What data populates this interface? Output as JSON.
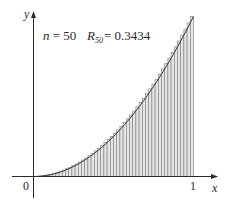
{
  "chart_data": {
    "type": "bar",
    "title": "",
    "function": "x^2",
    "n": 50,
    "method": "right endpoints",
    "xlabel": "x",
    "ylabel": "y",
    "xlim": [
      0,
      1
    ],
    "ylim": [
      0,
      1
    ],
    "x_tick_labels": [
      "0",
      "1"
    ],
    "annotation": {
      "n_text": "n = 50",
      "r_symbol": "R",
      "r_subscript": "50",
      "r_value_text": "= 0.3434",
      "R50": 0.3434
    },
    "categories": [
      0.02,
      0.04,
      0.06,
      0.08,
      0.1,
      0.12,
      0.14,
      0.16,
      0.18,
      0.2,
      0.22,
      0.24,
      0.26,
      0.28,
      0.3,
      0.32,
      0.34,
      0.36,
      0.38,
      0.4,
      0.42,
      0.44,
      0.46,
      0.48,
      0.5,
      0.52,
      0.54,
      0.56,
      0.58,
      0.6,
      0.62,
      0.64,
      0.66,
      0.68,
      0.7,
      0.72,
      0.74,
      0.76,
      0.78,
      0.8,
      0.82,
      0.84,
      0.86,
      0.88,
      0.9,
      0.92,
      0.94,
      0.96,
      0.98,
      1.0
    ],
    "values": [
      0.0004,
      0.0016,
      0.0036,
      0.0064,
      0.01,
      0.0144,
      0.0196,
      0.0256,
      0.0324,
      0.04,
      0.0484,
      0.0576,
      0.0676,
      0.0784,
      0.09,
      0.1024,
      0.1156,
      0.1296,
      0.1444,
      0.16,
      0.1764,
      0.1936,
      0.2116,
      0.2304,
      0.25,
      0.2704,
      0.2916,
      0.3136,
      0.3364,
      0.36,
      0.3844,
      0.4096,
      0.4356,
      0.4624,
      0.49,
      0.5184,
      0.5476,
      0.5776,
      0.6084,
      0.64,
      0.6724,
      0.7056,
      0.7396,
      0.7744,
      0.81,
      0.8464,
      0.8836,
      0.9216,
      0.9604,
      1.0
    ],
    "colors": {
      "bar_fill": "#e6e6e6",
      "bar_stroke": "#7a7a7a",
      "axis": "#2a2a2a",
      "curve": "#333333"
    },
    "grid": false,
    "legend": "none"
  }
}
